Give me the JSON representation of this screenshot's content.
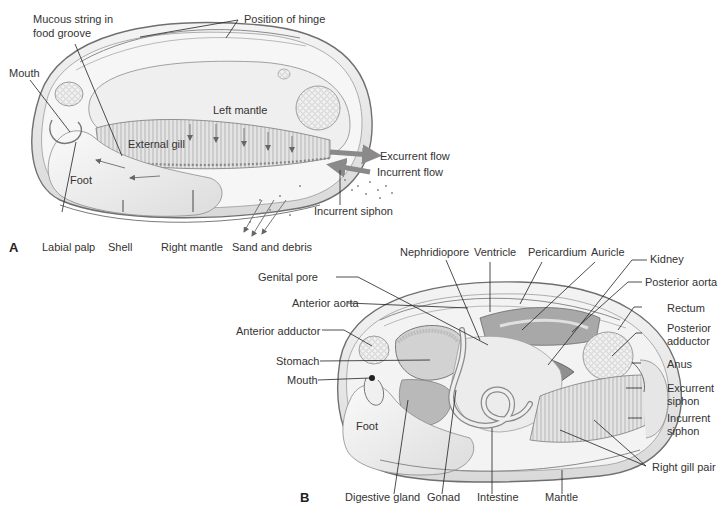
{
  "figure": {
    "panel_a": {
      "letter": "A",
      "labels": {
        "mucous_string_1": "Mucous string in",
        "mucous_string_2": "food groove",
        "position_of_hinge": "Position of hinge",
        "mouth": "Mouth",
        "left_mantle": "Left mantle",
        "external_gill": "External gill",
        "foot": "Foot",
        "excurrent_flow": "Excurrent flow",
        "incurrent_flow": "Incurrent flow",
        "incurrent_siphon": "Incurrent siphon",
        "labial_palp": "Labial palp",
        "shell": "Shell",
        "right_mantle": "Right mantle",
        "sand_and_debris": "Sand and debris"
      }
    },
    "panel_b": {
      "letter": "B",
      "labels": {
        "nephridiopore": "Nephridiopore",
        "ventricle": "Ventricle",
        "pericardium": "Pericardium",
        "auricle": "Auricle",
        "kidney": "Kidney",
        "genital_pore": "Genital pore",
        "posterior_aorta": "Posterior aorta",
        "anterior_aorta": "Anterior aorta",
        "rectum": "Rectum",
        "anterior_adductor": "Anterior adductor",
        "posterior_adductor_1": "Posterior",
        "posterior_adductor_2": "adductor",
        "stomach": "Stomach",
        "anus": "Anus",
        "mouth": "Mouth",
        "excurrent_siphon_1": "Excurrent",
        "excurrent_siphon_2": "siphon",
        "incurrent_siphon_1": "Incurrent",
        "incurrent_siphon_2": "siphon",
        "foot": "Foot",
        "right_gill_pair": "Right gill pair",
        "digestive_gland": "Digestive gland",
        "gonad": "Gonad",
        "intestine": "Intestine",
        "mantle": "Mantle"
      }
    },
    "colors": {
      "flow_arrow": "#8a8a8a",
      "shell_outline": "#6f6f6f",
      "tissue_fill": "#eeeeee",
      "dark_tissue": "#9a9a9a",
      "leader_line": "#222222",
      "label_text": "#333333"
    }
  }
}
